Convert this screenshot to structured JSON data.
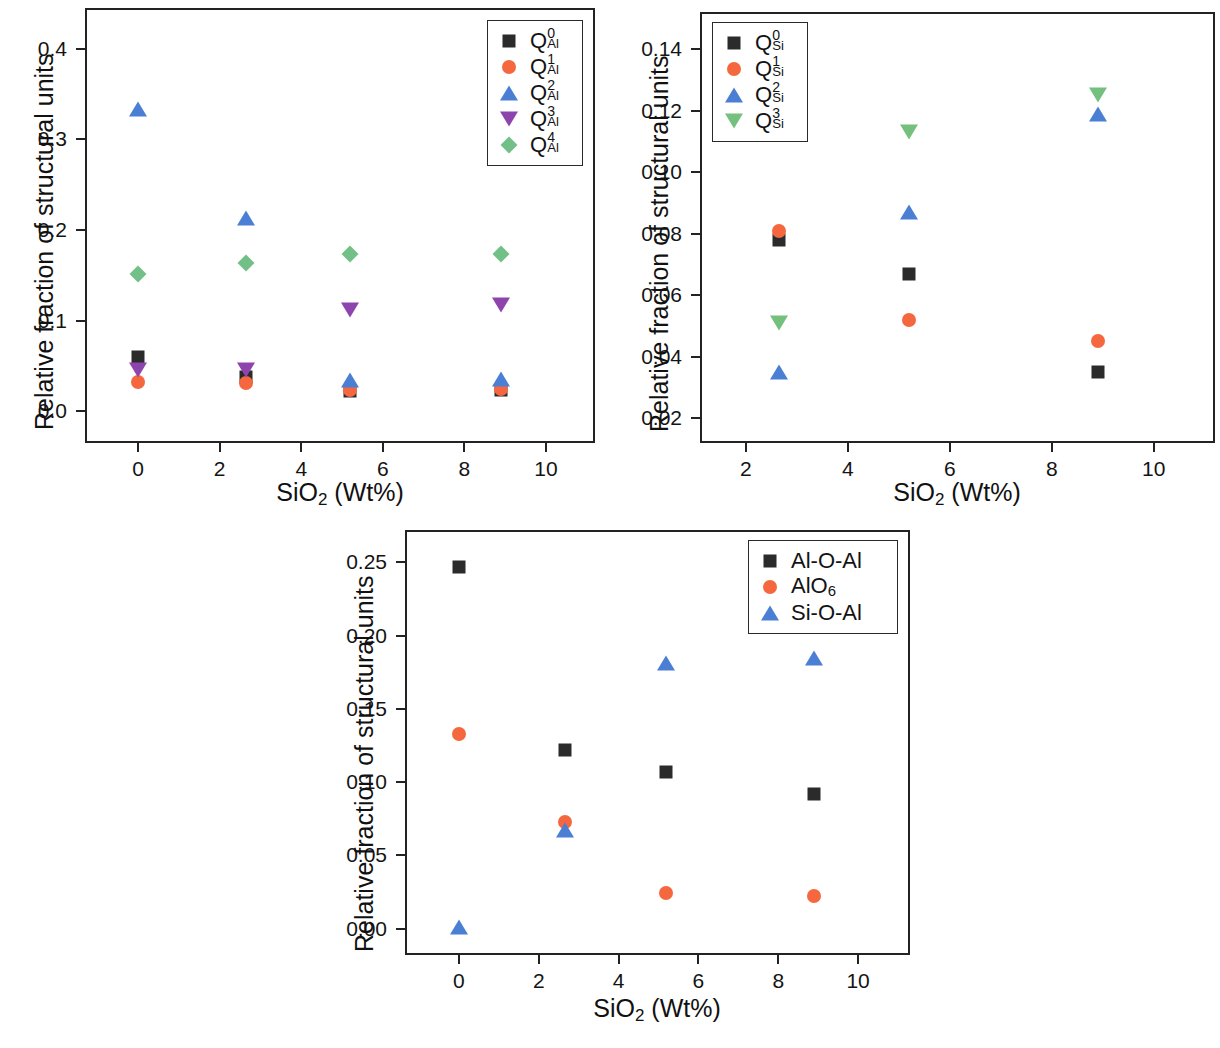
{
  "figure": {
    "title": "",
    "panels": [
      "panel_a",
      "panel_b",
      "panel_c"
    ]
  },
  "colors": {
    "black": "#2b2b2b",
    "orange": "#f4673f",
    "blue": "#4a7fd4",
    "purple": "#8e44ad",
    "green_diamond": "#72c087",
    "green_triangle": "#74c07c",
    "axis": "#232323"
  },
  "panel_a": {
    "ylabel": "Relative fraction of structural units",
    "xlabel_main": "SiO",
    "xlabel_sub": "2",
    "xlabel_tail": " (Wt%)",
    "x_ticks": [
      "0",
      "2",
      "4",
      "6",
      "8",
      "10"
    ],
    "x_tick_values": [
      0,
      2,
      4,
      6,
      8,
      10
    ],
    "y_ticks": [
      "0.0",
      "0.1",
      "0.2",
      "0.3",
      "0.4"
    ],
    "y_tick_values": [
      0.0,
      0.1,
      0.2,
      0.3,
      0.4
    ],
    "legend": [
      {
        "label_base": "Q",
        "sup": "0",
        "sub": "Al",
        "marker": "square",
        "color": "#2b2b2b"
      },
      {
        "label_base": "Q",
        "sup": "1",
        "sub": "Al",
        "marker": "circle",
        "color": "#f4673f"
      },
      {
        "label_base": "Q",
        "sup": "2",
        "sub": "Al",
        "marker": "triangle",
        "color": "#4a7fd4"
      },
      {
        "label_base": "Q",
        "sup": "3",
        "sub": "Al",
        "marker": "dtriangle",
        "color": "#8e44ad"
      },
      {
        "label_base": "Q",
        "sup": "4",
        "sub": "Al",
        "marker": "diamond",
        "color": "#72c087"
      }
    ]
  },
  "panel_b": {
    "ylabel": "Relative fraction of structural units",
    "xlabel_main": "SiO",
    "xlabel_sub": "2",
    "xlabel_tail": " (Wt%)",
    "x_ticks": [
      "2",
      "4",
      "6",
      "8",
      "10"
    ],
    "x_tick_values": [
      2,
      4,
      6,
      8,
      10
    ],
    "y_ticks": [
      "0.02",
      "0.04",
      "0.06",
      "0.08",
      "0.10",
      "0.12",
      "0.14"
    ],
    "y_tick_values": [
      0.02,
      0.04,
      0.06,
      0.08,
      0.1,
      0.12,
      0.14
    ],
    "legend": [
      {
        "label_base": "Q",
        "sup": "0",
        "sub": "Si",
        "marker": "square",
        "color": "#2b2b2b"
      },
      {
        "label_base": "Q",
        "sup": "1",
        "sub": "Si",
        "marker": "circle",
        "color": "#f4673f"
      },
      {
        "label_base": "Q",
        "sup": "2",
        "sub": "Si",
        "marker": "triangle",
        "color": "#4a7fd4"
      },
      {
        "label_base": "Q",
        "sup": "3",
        "sub": "Si",
        "marker": "dtriangle-green",
        "color": "#74c07c"
      }
    ]
  },
  "panel_c": {
    "ylabel": "Relative fraction of structural units",
    "xlabel_main": "SiO",
    "xlabel_sub": "2",
    "xlabel_tail": " (Wt%)",
    "x_ticks": [
      "0",
      "2",
      "4",
      "6",
      "8",
      "10"
    ],
    "x_tick_values": [
      0,
      2,
      4,
      6,
      8,
      10
    ],
    "y_ticks": [
      "0.00",
      "0.05",
      "0.10",
      "0.15",
      "0.20",
      "0.25"
    ],
    "y_tick_values": [
      0.0,
      0.05,
      0.1,
      0.15,
      0.2,
      0.25
    ],
    "legend": [
      {
        "label_base": "Al-O-Al",
        "sup": "",
        "sub": "",
        "marker": "square",
        "color": "#2b2b2b"
      },
      {
        "label_base": "AlO",
        "sup": "",
        "sub": "6",
        "marker": "circle",
        "color": "#f4673f"
      },
      {
        "label_base": "Si-O-Al",
        "sup": "",
        "sub": "",
        "marker": "triangle",
        "color": "#4a7fd4"
      }
    ]
  },
  "chart_data": [
    {
      "id": "panel_a",
      "type": "scatter",
      "title": "",
      "xlabel": "SiO2 (Wt%)",
      "ylabel": "Relative fraction of structural units",
      "xlim": [
        -1.3,
        11.2
      ],
      "ylim": [
        -0.035,
        0.445
      ],
      "grid": false,
      "legend_position": "top-right",
      "x": [
        0,
        2.65,
        5.2,
        8.9
      ],
      "series": [
        {
          "name": "Q0_Al",
          "marker": "square",
          "color": "#2b2b2b",
          "values": [
            0.06,
            0.038,
            0.022,
            0.024
          ]
        },
        {
          "name": "Q1_Al",
          "marker": "circle",
          "color": "#f4673f",
          "values": [
            0.032,
            0.031,
            0.024,
            0.025
          ]
        },
        {
          "name": "Q2_Al",
          "marker": "triangle",
          "color": "#4a7fd4",
          "values": [
            0.334,
            0.213,
            0.034,
            0.036
          ]
        },
        {
          "name": "Q3_Al",
          "marker": "dtriangle",
          "color": "#8e44ad",
          "values": [
            0.046,
            0.046,
            0.112,
            0.117
          ]
        },
        {
          "name": "Q4_Al",
          "marker": "diamond",
          "color": "#72c087",
          "values": [
            0.152,
            0.164,
            0.174,
            0.174
          ]
        }
      ]
    },
    {
      "id": "panel_b",
      "type": "scatter",
      "title": "",
      "xlabel": "SiO2 (Wt%)",
      "ylabel": "Relative fraction of structural units",
      "xlim": [
        1.1,
        11.2
      ],
      "ylim": [
        0.012,
        0.152
      ],
      "grid": false,
      "legend_position": "top-left",
      "x": [
        2.65,
        5.2,
        8.9
      ],
      "series": [
        {
          "name": "Q0_Si",
          "marker": "square",
          "color": "#2b2b2b",
          "values": [
            0.078,
            0.067,
            0.035
          ]
        },
        {
          "name": "Q1_Si",
          "marker": "circle",
          "color": "#f4673f",
          "values": [
            0.081,
            0.052,
            0.045
          ]
        },
        {
          "name": "Q2_Si",
          "marker": "triangle",
          "color": "#4a7fd4",
          "values": [
            0.035,
            0.087,
            0.119
          ]
        },
        {
          "name": "Q3_Si",
          "marker": "dtriangle-green",
          "color": "#74c07c",
          "values": [
            0.051,
            0.113,
            0.125
          ]
        }
      ]
    },
    {
      "id": "panel_c",
      "type": "scatter",
      "title": "",
      "xlabel": "SiO2 (Wt%)",
      "ylabel": "Relative fraction of structural units",
      "xlim": [
        -1.35,
        11.3
      ],
      "ylim": [
        -0.018,
        0.272
      ],
      "grid": false,
      "legend_position": "top-right",
      "x": [
        0,
        2.65,
        5.2,
        8.9
      ],
      "series": [
        {
          "name": "Al-O-Al",
          "marker": "square",
          "color": "#2b2b2b",
          "values": [
            0.247,
            0.122,
            0.107,
            0.092
          ]
        },
        {
          "name": "AlO6",
          "marker": "circle",
          "color": "#f4673f",
          "values": [
            0.133,
            0.073,
            0.024,
            0.022
          ]
        },
        {
          "name": "Si-O-Al",
          "marker": "triangle",
          "color": "#4a7fd4",
          "values": [
            0.001,
            0.067,
            0.181,
            0.185
          ]
        }
      ]
    }
  ]
}
